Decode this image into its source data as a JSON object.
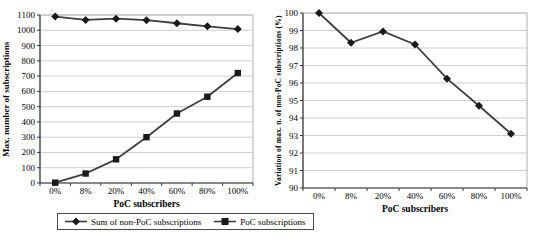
{
  "figure": {
    "background": "#ffffff",
    "colors": {
      "line": "#3f3f3f",
      "marker": "#1a1a1a",
      "gridline": "#c9c9c9",
      "axis": "#3a3a3a",
      "plot_border": "#9c9c9c",
      "text": "#000000"
    }
  },
  "chart_data": [
    {
      "type": "line",
      "title": "",
      "categories": [
        "0%",
        "8%",
        "20%",
        "40%",
        "60%",
        "80%",
        "100%"
      ],
      "series": [
        {
          "name": "Sum of non-PoC subscriptions",
          "marker": "diamond",
          "values": [
            1090,
            1068,
            1076,
            1066,
            1046,
            1026,
            1008
          ]
        },
        {
          "name": "PoC subscriptions",
          "marker": "square",
          "values": [
            2,
            62,
            155,
            300,
            455,
            565,
            720
          ]
        }
      ],
      "xlabel": "PoC subscribers",
      "ylabel": "Max. number of subscriptions",
      "ylim": [
        0,
        1100
      ],
      "ytick_step": 100,
      "grid": true,
      "legend_position": "bottom"
    },
    {
      "type": "line",
      "title": "",
      "categories": [
        "0%",
        "8%",
        "20%",
        "40%",
        "60%",
        "80%",
        "100%"
      ],
      "series": [
        {
          "name": "Variation of max. n. of non-PoC subscriptions",
          "marker": "diamond",
          "values": [
            100,
            98.3,
            98.95,
            98.2,
            96.25,
            94.7,
            93.1
          ]
        }
      ],
      "xlabel": "PoC subscribers",
      "ylabel": "Variation of max. n. of non-PoC subscriptions (%)",
      "ylim": [
        90,
        100
      ],
      "ytick_step": 1,
      "grid": true,
      "legend_position": "none"
    }
  ]
}
